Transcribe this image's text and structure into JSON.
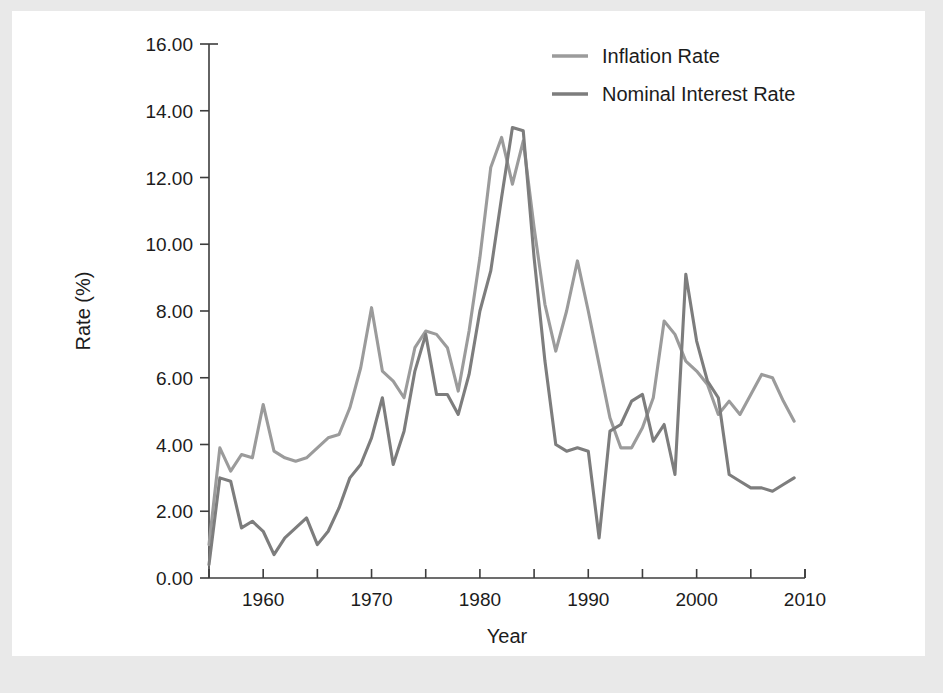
{
  "figure": {
    "background_color": "#e9e9e9",
    "card_color": "#ffffff"
  },
  "chart_data": {
    "type": "line",
    "title": "",
    "xlabel": "Year",
    "ylabel": "Rate (%)",
    "xlim": [
      1955,
      2010
    ],
    "ylim": [
      0,
      16
    ],
    "xticks": [
      1960,
      1970,
      1980,
      1990,
      2000,
      2010
    ],
    "xtick_labels": [
      "1960",
      "1970",
      "1980",
      "1990",
      "2000",
      "2010"
    ],
    "xminor_ticks": [
      1955,
      1965,
      1975,
      1985,
      1995,
      2005
    ],
    "yticks": [
      0,
      2,
      4,
      6,
      8,
      10,
      12,
      14,
      16
    ],
    "ytick_labels": [
      "0.00",
      "2.00",
      "4.00",
      "6.00",
      "8.00",
      "10.00",
      "12.00",
      "14.00",
      "16.00"
    ],
    "grid": false,
    "legend_position": "top-center",
    "x": [
      1955,
      1956,
      1957,
      1958,
      1959,
      1960,
      1961,
      1962,
      1963,
      1964,
      1965,
      1966,
      1967,
      1968,
      1969,
      1970,
      1971,
      1972,
      1973,
      1974,
      1975,
      1976,
      1977,
      1978,
      1979,
      1980,
      1981,
      1982,
      1983,
      1984,
      1985,
      1986,
      1987,
      1988,
      1989,
      1990,
      1991,
      1992,
      1993,
      1994,
      1995,
      1996,
      1997,
      1998,
      1999,
      2000,
      2001,
      2002,
      2003,
      2004,
      2005,
      2006,
      2007,
      2008,
      2009
    ],
    "series": [
      {
        "name": "Inflation Rate",
        "color": "#9b9b9b",
        "values": [
          1.0,
          3.9,
          3.2,
          3.7,
          3.6,
          5.2,
          3.8,
          3.6,
          3.5,
          3.6,
          3.9,
          4.2,
          4.3,
          5.1,
          6.3,
          8.1,
          6.2,
          5.9,
          5.4,
          6.9,
          7.4,
          7.3,
          6.9,
          5.6,
          7.4,
          9.6,
          12.3,
          13.2,
          11.8,
          13.1,
          10.5,
          8.2,
          6.8,
          8.0,
          9.5,
          8.0,
          6.4,
          4.8,
          3.9,
          3.9,
          4.5,
          5.4,
          7.7,
          7.3,
          6.5,
          6.2,
          5.8,
          4.9,
          5.3,
          4.9,
          5.5,
          6.1,
          6.0,
          5.3,
          4.7
        ],
        "comment": "lighter grey upper series in early and mid period"
      },
      {
        "name": "Nominal Interest Rate",
        "color": "#7d7d7d",
        "values": [
          0.4,
          3.0,
          2.9,
          1.5,
          1.7,
          1.4,
          0.7,
          1.2,
          1.5,
          1.8,
          1.0,
          1.4,
          2.1,
          3.0,
          3.4,
          4.2,
          5.4,
          3.4,
          4.4,
          6.2,
          7.3,
          5.5,
          5.5,
          4.9,
          6.1,
          8.0,
          9.2,
          11.4,
          13.5,
          13.4,
          9.6,
          6.5,
          4.0,
          3.8,
          3.9,
          3.8,
          1.2,
          4.4,
          4.6,
          5.3,
          5.5,
          4.1,
          4.6,
          3.1,
          9.1,
          7.1,
          5.9,
          5.4,
          3.1,
          2.9,
          2.7,
          2.7,
          2.6,
          2.8,
          3.0
        ],
        "comment": "darker grey, lower in early period, tallest 1980s peak"
      }
    ]
  },
  "legend": {
    "entries": [
      {
        "label": "Inflation Rate",
        "color": "#9b9b9b"
      },
      {
        "label": "Nominal Interest Rate",
        "color": "#7d7d7d"
      }
    ]
  },
  "axes": {
    "y_axis_title": "Rate (%)",
    "x_axis_title": "Year"
  }
}
